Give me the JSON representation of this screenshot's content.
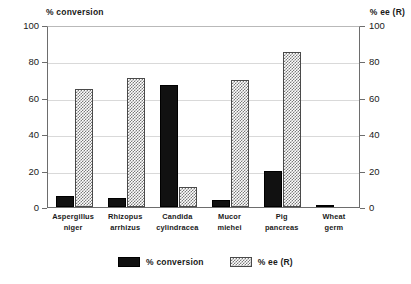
{
  "chart_data": {
    "type": "bar",
    "title": "",
    "subtitle": "",
    "xlabel": "",
    "ylabel": "% conversion",
    "y2label": "% ee (R)",
    "ylim": [
      0,
      100
    ],
    "y2lim": [
      0,
      100
    ],
    "yticks": [
      0,
      20,
      40,
      60,
      80,
      100
    ],
    "y2ticks": [
      0,
      20,
      40,
      60,
      80,
      100
    ],
    "ytick_labels": [
      "0",
      "20",
      "40",
      "60",
      "80",
      "100"
    ],
    "y2tick_labels": [
      "0",
      "20",
      "40",
      "60",
      "80",
      "100"
    ],
    "grid": true,
    "legend_position": "bottom-center",
    "categories": [
      "Aspergillus niger",
      "Rhizopus arrhizus",
      "Candida cylindracea",
      "Mucor miehei",
      "Pig pancreas",
      "Wheat germ"
    ],
    "category_lines": [
      [
        "Aspergillus",
        "niger"
      ],
      [
        "Rhizopus",
        "arrhizus"
      ],
      [
        "Candida",
        "cylindracea"
      ],
      [
        "Mucor",
        "miehei"
      ],
      [
        "Pig",
        "pancreas"
      ],
      [
        "Wheat",
        "germ"
      ]
    ],
    "series": [
      {
        "name": "% conversion",
        "axis": "left",
        "fill": "solid-black",
        "color": "#111111",
        "values": [
          6,
          5,
          67,
          4,
          20,
          1
        ]
      },
      {
        "name": "% ee (R)",
        "axis": "right",
        "fill": "cross-hatch",
        "color": "#7a7a7a",
        "values": [
          65,
          71,
          11,
          70,
          85,
          0
        ]
      }
    ],
    "legend": [
      "% conversion",
      "% ee (R)"
    ]
  },
  "axes": {
    "left_title": "% conversion",
    "right_title": "% ee (R)"
  },
  "legend": {
    "items": [
      {
        "label": "% conversion"
      },
      {
        "label": "% ee (R)"
      }
    ]
  }
}
